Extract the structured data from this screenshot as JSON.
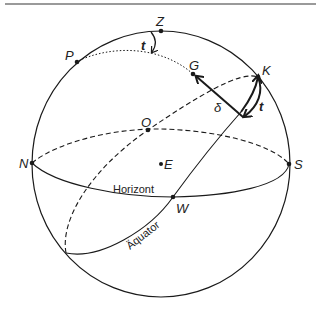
{
  "diagram": {
    "type": "celestial-sphere",
    "points": {
      "Z": "Z",
      "P": "P",
      "G": "G",
      "K": "K",
      "O": "O",
      "E": "E",
      "N": "N",
      "S": "S",
      "W": "W"
    },
    "angle_labels": {
      "t_top": "t",
      "t_right": "t",
      "delta": "δ"
    },
    "curves": {
      "horizon": "Horizont",
      "equator": "Äquator"
    },
    "colors": {
      "stroke": "#1a1a1a",
      "frame_line": "#9a9a9a",
      "background": "#ffffff"
    }
  }
}
